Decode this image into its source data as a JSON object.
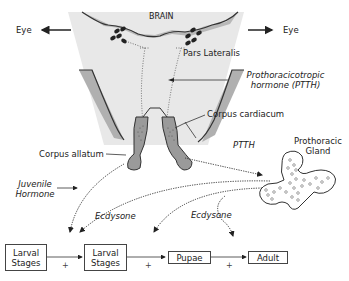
{
  "diagram": {
    "labels": {
      "eye_left": "Eye",
      "eye_right": "Eye",
      "brain": "BRAIN",
      "pars_lateralis": "Pars Lateralis",
      "ptth_line1": "Prothoracicotropic",
      "ptth_line2": "hormone (PTTH)",
      "corpus_cardiacum": "Corpus cardiacum",
      "corpus_allatum": "Corpus allatum",
      "ptth_arrow": "PTTH",
      "prothoracic_gland_line1": "Prothoracic",
      "prothoracic_gland_line2": "Gland",
      "juvenile_line1": "Juvenile",
      "juvenile_line2": "Hormone",
      "ecdysone_1": "Ecdysone",
      "ecdysone_2": "Ecdysone"
    },
    "stages": [
      {
        "line1": "Larval",
        "line2": "Stages"
      },
      {
        "line1": "Larval",
        "line2": "Stages"
      },
      {
        "line1": "Pupae",
        "line2": ""
      },
      {
        "line1": "Adult",
        "line2": ""
      }
    ],
    "plus_signs": [
      "+",
      "+",
      "+"
    ],
    "colors": {
      "background_panel": "#e6e6e6",
      "gland_fill": "#9a9a9a",
      "outline": "#333333",
      "nuclei": "#222222"
    }
  }
}
